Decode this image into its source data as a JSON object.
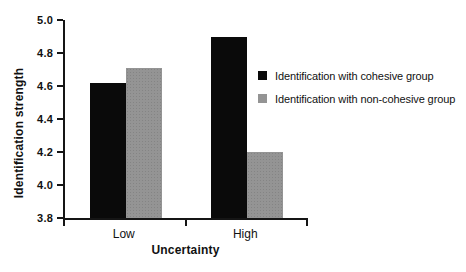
{
  "chart_data": {
    "type": "bar",
    "title": "",
    "categories": [
      "Low",
      "High"
    ],
    "series": [
      {
        "name": "Identification with cohesive group",
        "color": "#0a0a0a",
        "values": [
          4.62,
          4.9
        ]
      },
      {
        "name": "Identification with non-cohesive group",
        "color": "#949494",
        "values": [
          4.71,
          4.2
        ]
      }
    ],
    "xlabel": "Uncertainty",
    "ylabel": "Identification strength",
    "ylim": [
      3.8,
      5.0
    ],
    "ytick_labels": [
      "5.0",
      "4.8",
      "4.6",
      "4.4",
      "4.2",
      "4.0",
      "3.8"
    ],
    "grid": false,
    "legend_position": "right",
    "colors": {
      "axis": "#151515",
      "background": "#ffffff",
      "text": "#111111"
    }
  }
}
